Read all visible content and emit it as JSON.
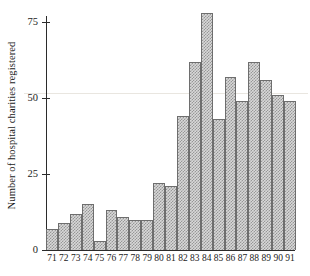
{
  "chart_data": {
    "type": "bar",
    "title": "",
    "subtitle": "",
    "xlabel": "",
    "ylabel": "Number of hospital charities registered",
    "categories": [
      "71",
      "72",
      "73",
      "74",
      "75",
      "76",
      "77",
      "78",
      "79",
      "80",
      "81",
      "82",
      "83",
      "84",
      "85",
      "86",
      "87",
      "88",
      "89",
      "90",
      "91"
    ],
    "values": [
      7,
      9,
      12,
      15,
      3,
      13,
      11,
      10,
      10,
      22,
      21,
      44,
      62,
      78,
      43,
      57,
      49,
      62,
      56,
      51,
      49
    ],
    "series": [
      {
        "name": "Hospital charities registered",
        "values": [
          7,
          9,
          12,
          15,
          3,
          13,
          11,
          10,
          10,
          22,
          21,
          44,
          62,
          78,
          43,
          57,
          49,
          62,
          56,
          51,
          49
        ]
      }
    ],
    "ylim": [
      0,
      80
    ],
    "yticks": [
      0,
      25,
      50,
      75
    ],
    "ytick_labels": [
      "0",
      "25",
      "50",
      "75"
    ],
    "xtick_labels": [
      "71",
      "72",
      "73",
      "74",
      "75",
      "76",
      "77",
      "78",
      "79",
      "80",
      "81",
      "82",
      "83",
      "84",
      "85",
      "86",
      "87",
      "88",
      "89",
      "90",
      "91"
    ],
    "grid": false,
    "legend": false,
    "legend_position": "none",
    "bar_fill": "#d8d8d8",
    "bar_edge": "#6e6e6e",
    "axis_color": "#2b2b2b",
    "background": "#ffffff",
    "annotations": []
  },
  "axis": {
    "y_title": "Number of hospital charities registered",
    "y_ticks": [
      {
        "label": "75",
        "value": 75
      },
      {
        "label": "50",
        "value": 50
      },
      {
        "label": "25",
        "value": 25
      },
      {
        "label": "0",
        "value": 0
      }
    ]
  }
}
